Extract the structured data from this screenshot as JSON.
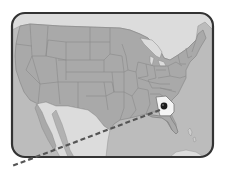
{
  "illustration": {
    "subject": "map of the United States",
    "highlighted_state": "Georgia",
    "marker": "location-pin",
    "path_style": "dashed line",
    "colors": {
      "background": "#ffffff",
      "land_us": "#a8a8a8",
      "land_foreign": "#dedede",
      "water": "#bdbdbd",
      "borders": "#8a8a8a",
      "frame": "#3a3a3a",
      "highlight": "#f4f4f4",
      "marker": "#222222",
      "dashed_line": "#555555"
    }
  }
}
